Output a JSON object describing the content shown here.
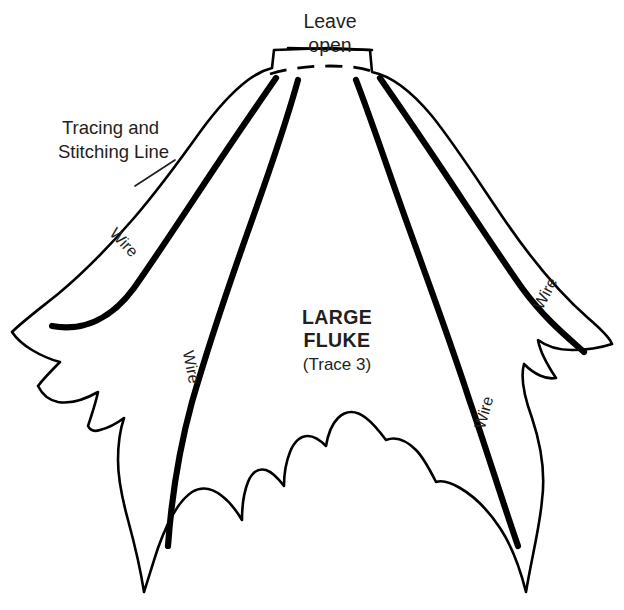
{
  "document": {
    "kind": "sewing-pattern-diagram",
    "background_color": "#ffffff",
    "ink_color": "#000000",
    "text_color": "#231f20"
  },
  "labels": {
    "leave_open_line1": "Leave",
    "leave_open_line2": "open",
    "tracing_line1": "Tracing and",
    "tracing_line2": "Stitching Line",
    "title_line1": "LARGE",
    "title_line2": "FLUKE",
    "trace_note": "(Trace 3)"
  },
  "wire_labels": [
    {
      "id": "wire-left-outer",
      "text": "Wire",
      "x": 120,
      "y": 246,
      "rotation": 47
    },
    {
      "id": "wire-left-inner",
      "text": "Wire",
      "x": 186,
      "y": 368,
      "rotation": 79
    },
    {
      "id": "wire-right-inner",
      "text": "Wire",
      "x": 489,
      "y": 414,
      "rotation": -74
    },
    {
      "id": "wire-right-outer",
      "text": "Wire",
      "x": 550,
      "y": 296,
      "rotation": -62
    }
  ],
  "shapes": {
    "outline": "M 330 48 L 370 50 L 372 72 C 392 76 412 92 432 116 C 456 146 480 184 506 222 C 528 254 556 290 588 318 C 602 330 610 338 612 344 C 600 348 586 350 572 350 C 558 350 546 346 538 340 C 540 352 548 366 556 378 C 546 380 534 374 524 364 C 520 378 524 396 532 418 C 540 442 546 470 542 500 C 540 526 532 556 526 592 C 520 568 512 546 500 528 C 488 510 474 496 460 488 C 450 482 442 480 436 482 C 430 470 424 458 416 450 C 406 440 396 436 386 440 C 380 432 374 424 366 418 C 356 410 346 410 338 418 C 332 424 328 434 326 446 C 320 440 314 436 308 436 C 300 436 294 442 290 452 C 286 462 284 474 284 486 C 278 478 272 472 266 470 C 258 468 252 472 248 482 C 244 492 242 506 242 520 C 236 510 230 502 222 496 C 212 488 202 486 192 492 C 180 500 168 520 158 548 C 152 566 148 580 144 592 C 140 566 134 542 128 520 C 122 498 118 478 118 460 C 118 444 120 430 124 418 C 116 424 108 428 100 430 C 94 432 90 430 88 426 C 92 414 96 402 98 392 C 84 400 70 404 58 402 C 48 400 42 394 38 386 C 44 378 52 370 60 362 C 52 360 42 356 32 350 C 22 344 16 338 12 332 C 22 322 38 310 58 294 C 82 274 108 248 134 218 C 158 190 180 160 200 132 C 216 110 232 92 248 80 C 256 74 264 70 272 68 L 274 50 Z",
    "neck_top": "M 288 48 L 372 50",
    "open_dash": "M 270 74 C 290 68 310 66 330 66 C 350 66 364 68 374 72",
    "wires": [
      "M 276 78 C 258 104 236 136 212 172 C 188 208 162 248 134 288 C 112 318 84 332 52 326",
      "M 298 80 C 288 116 272 164 252 220 C 232 276 210 340 192 402 C 180 446 172 490 168 546",
      "M 356 80 C 370 116 386 164 406 220 C 426 276 450 340 470 402 C 486 448 502 500 518 546",
      "M 380 78 C 398 104 420 136 444 172 C 468 208 494 248 522 288 C 544 318 566 336 584 352"
    ],
    "leader": "M 175 160 L 135 186"
  }
}
